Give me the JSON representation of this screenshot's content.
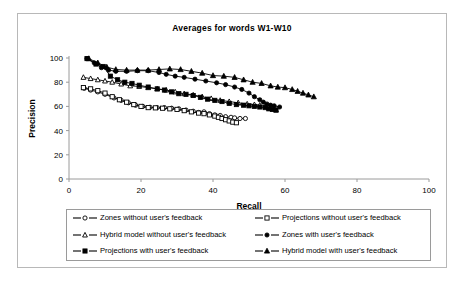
{
  "chart_data": {
    "type": "line",
    "title": "Averages for words W1-W10",
    "xlabel": "Recall",
    "ylabel": "Precision",
    "xlim": [
      0,
      100
    ],
    "ylim": [
      0,
      100
    ],
    "xticks": [
      0,
      20,
      40,
      60,
      80,
      100
    ],
    "yticks": [
      0,
      20,
      40,
      60,
      80,
      100
    ],
    "grid": false,
    "legend_position": "bottom",
    "series": [
      {
        "name": "Zones without user's feedback",
        "marker": "open-circle",
        "color": "#000000",
        "points": [
          [
            4.2,
            75.0
          ],
          [
            6.0,
            73.5
          ],
          [
            8.0,
            72.0
          ],
          [
            10.0,
            70.0
          ],
          [
            12.5,
            67.0
          ],
          [
            14.5,
            65.0
          ],
          [
            16.5,
            63.0
          ],
          [
            18.5,
            61.0
          ],
          [
            20.5,
            60.0
          ],
          [
            22.5,
            59.3
          ],
          [
            24.5,
            59.0
          ],
          [
            26.5,
            59.0
          ],
          [
            28.5,
            58.5
          ],
          [
            30.5,
            58.0
          ],
          [
            32.5,
            57.0
          ],
          [
            34.5,
            56.0
          ],
          [
            36.0,
            55.0
          ],
          [
            37.5,
            55.5
          ],
          [
            39.0,
            54.0
          ],
          [
            40.5,
            53.0
          ],
          [
            42.0,
            52.5
          ],
          [
            43.5,
            51.5
          ],
          [
            45.0,
            51.0
          ],
          [
            46.0,
            50.5
          ],
          [
            47.5,
            50.0
          ],
          [
            49.0,
            50.0
          ]
        ]
      },
      {
        "name": "Projections without user's feedback",
        "marker": "open-square",
        "color": "#000000",
        "points": [
          [
            4.0,
            75.5
          ],
          [
            6.0,
            74.5
          ],
          [
            8.0,
            73.0
          ],
          [
            10.0,
            71.0
          ],
          [
            12.0,
            68.0
          ],
          [
            14.0,
            65.5
          ],
          [
            16.0,
            63.5
          ],
          [
            18.0,
            61.5
          ],
          [
            20.0,
            60.0
          ],
          [
            22.0,
            59.0
          ],
          [
            24.0,
            58.8
          ],
          [
            26.0,
            58.5
          ],
          [
            28.0,
            58.0
          ],
          [
            30.0,
            57.5
          ],
          [
            32.0,
            56.5
          ],
          [
            34.0,
            55.5
          ],
          [
            36.0,
            54.5
          ],
          [
            37.5,
            54.0
          ],
          [
            39.0,
            53.0
          ],
          [
            40.5,
            52.0
          ],
          [
            41.5,
            51.0
          ],
          [
            42.5,
            50.0
          ],
          [
            43.5,
            49.0
          ],
          [
            44.5,
            48.0
          ],
          [
            45.5,
            47.0
          ],
          [
            46.5,
            46.5
          ]
        ]
      },
      {
        "name": "Hybrid model without user's feedback",
        "marker": "open-triangle",
        "color": "#000000",
        "points": [
          [
            4.0,
            84.0
          ],
          [
            6.0,
            83.0
          ],
          [
            8.0,
            82.0
          ],
          [
            10.0,
            81.0
          ],
          [
            12.0,
            80.0
          ],
          [
            14.5,
            78.5
          ],
          [
            17.0,
            77.0
          ],
          [
            19.5,
            76.5
          ],
          [
            22.0,
            75.5
          ],
          [
            24.5,
            74.5
          ],
          [
            27.0,
            73.5
          ],
          [
            29.5,
            72.0
          ],
          [
            32.0,
            70.5
          ],
          [
            34.5,
            69.5
          ],
          [
            37.0,
            68.0
          ],
          [
            39.5,
            66.5
          ],
          [
            42.0,
            65.0
          ],
          [
            44.5,
            64.0
          ],
          [
            47.0,
            63.0
          ],
          [
            49.5,
            62.0
          ],
          [
            51.5,
            61.5
          ],
          [
            53.0,
            61.0
          ],
          [
            54.5,
            60.0
          ],
          [
            55.5,
            59.0
          ],
          [
            56.5,
            58.0
          ],
          [
            57.5,
            57.0
          ]
        ]
      },
      {
        "name": "Zones with user's feedback",
        "marker": "filled-circle",
        "color": "#000000",
        "points": [
          [
            5.0,
            99.5
          ],
          [
            7.0,
            96.0
          ],
          [
            9.0,
            92.0
          ],
          [
            11.0,
            90.0
          ],
          [
            13.0,
            89.0
          ],
          [
            16.0,
            89.0
          ],
          [
            19.0,
            89.5
          ],
          [
            22.0,
            89.5
          ],
          [
            25.0,
            88.0
          ],
          [
            27.0,
            86.5
          ],
          [
            29.5,
            85.0
          ],
          [
            32.0,
            84.0
          ],
          [
            35.0,
            82.5
          ],
          [
            38.0,
            81.0
          ],
          [
            41.0,
            79.5
          ],
          [
            43.5,
            78.0
          ],
          [
            46.0,
            76.0
          ],
          [
            48.0,
            74.0
          ],
          [
            50.0,
            71.0
          ],
          [
            51.5,
            68.0
          ],
          [
            53.0,
            65.5
          ],
          [
            54.0,
            63.5
          ],
          [
            55.0,
            62.0
          ],
          [
            56.0,
            61.0
          ],
          [
            57.0,
            60.5
          ],
          [
            58.5,
            59.5
          ]
        ]
      },
      {
        "name": "Projections with user's feedback",
        "marker": "filled-square",
        "color": "#000000",
        "points": [
          [
            5.0,
            99.5
          ],
          [
            7.5,
            95.0
          ],
          [
            9.5,
            93.0
          ],
          [
            11.5,
            85.0
          ],
          [
            13.5,
            82.0
          ],
          [
            15.5,
            80.0
          ],
          [
            17.5,
            79.0
          ],
          [
            19.5,
            77.5
          ],
          [
            22.0,
            76.0
          ],
          [
            24.5,
            74.5
          ],
          [
            26.5,
            73.5
          ],
          [
            28.5,
            72.0
          ],
          [
            30.5,
            70.5
          ],
          [
            32.5,
            70.0
          ],
          [
            34.5,
            69.0
          ],
          [
            36.5,
            67.5
          ],
          [
            38.5,
            66.0
          ],
          [
            40.5,
            65.0
          ],
          [
            42.5,
            64.0
          ],
          [
            44.5,
            62.5
          ],
          [
            46.5,
            61.5
          ],
          [
            48.5,
            61.0
          ],
          [
            50.0,
            60.5
          ],
          [
            51.5,
            60.0
          ],
          [
            53.0,
            59.5
          ],
          [
            54.5,
            59.0
          ],
          [
            55.5,
            58.0
          ],
          [
            56.5,
            57.5
          ],
          [
            57.5,
            57.0
          ]
        ]
      },
      {
        "name": "Hybrid model with user's feedback",
        "marker": "filled-triangle",
        "color": "#000000",
        "points": [
          [
            5.5,
            99.5
          ],
          [
            8.0,
            96.0
          ],
          [
            10.5,
            92.5
          ],
          [
            13.0,
            90.5
          ],
          [
            16.0,
            90.0
          ],
          [
            19.0,
            90.0
          ],
          [
            22.0,
            90.0
          ],
          [
            25.0,
            90.5
          ],
          [
            28.0,
            91.0
          ],
          [
            31.0,
            90.5
          ],
          [
            34.0,
            89.0
          ],
          [
            37.0,
            87.5
          ],
          [
            40.0,
            85.5
          ],
          [
            43.0,
            85.0
          ],
          [
            46.0,
            84.0
          ],
          [
            48.5,
            82.0
          ],
          [
            51.0,
            80.0
          ],
          [
            53.5,
            79.0
          ],
          [
            56.0,
            77.0
          ],
          [
            58.0,
            76.0
          ],
          [
            60.0,
            75.5
          ],
          [
            62.0,
            74.0
          ],
          [
            63.5,
            72.5
          ],
          [
            65.0,
            71.0
          ],
          [
            66.5,
            69.5
          ],
          [
            68.0,
            68.0
          ]
        ]
      }
    ]
  },
  "legend": {
    "rows": [
      [
        {
          "label": "Zones without user's feedback",
          "marker": "open-circle"
        },
        {
          "label": "Projections without user's feedback",
          "marker": "open-square"
        }
      ],
      [
        {
          "label": "Hybrid model without user's feedback",
          "marker": "open-triangle"
        },
        {
          "label": "Zones with user's feedback",
          "marker": "filled-circle"
        }
      ],
      [
        {
          "label": "Projections with user's feedback",
          "marker": "filled-square"
        },
        {
          "label": "Hybrid model with user's feedback",
          "marker": "filled-triangle"
        }
      ]
    ]
  }
}
